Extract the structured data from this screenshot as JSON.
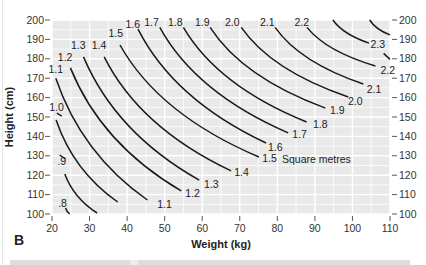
{
  "panel_label": "B",
  "chart_data": {
    "type": "line",
    "title": "",
    "xlabel": "Weight (kg)",
    "ylabel": "Height (cm)",
    "xlim": [
      20,
      110
    ],
    "ylim": [
      100,
      200
    ],
    "x_ticks": [
      20,
      30,
      40,
      50,
      60,
      70,
      80,
      90,
      100,
      110
    ],
    "y_ticks": [
      100,
      110,
      120,
      130,
      140,
      150,
      160,
      170,
      180,
      190,
      200
    ],
    "y_ticks_right": true,
    "grid": true,
    "background": "#e9e9e9",
    "grid_color": "#ffffff",
    "line_color": "#1a1a1a",
    "units_annotation": "Square metres",
    "series": [
      {
        "name": ".8",
        "label": ".8",
        "start": [
          23.6,
          103.1
        ],
        "end": [
          24.7,
          100.0
        ],
        "label_pos": [
          22.8,
          103.6
        ],
        "label_at": "start"
      },
      {
        "name": ".9",
        "label": ".9",
        "start": [
          23.4,
          120.6
        ],
        "end": [
          32.0,
          100.5
        ],
        "label_pos": [
          22.6,
          125.3
        ],
        "label_at": "start",
        "tail": [
          [
            22.0,
            130.4
          ],
          [
            23.6,
            128.4
          ]
        ]
      },
      {
        "name": "1.0",
        "label": "1.0",
        "start": [
          21.1,
          148.5
        ],
        "end": [
          37.5,
          106.2
        ],
        "label_pos": [
          21.2,
          153.0
        ],
        "label_at": "start",
        "tail": [
          [
            21.3,
            152.0
          ],
          [
            22.6,
            150.5
          ]
        ]
      },
      {
        "name": "1.1",
        "label": "1.1",
        "start": [
          21.0,
          170.0
        ],
        "end": [
          45.4,
          107.2
        ],
        "label_pos": [
          21.0,
          172.7
        ],
        "label_at": "start",
        "end_label": "1.1",
        "end_label_pos": [
          48.0,
          103.0
        ]
      },
      {
        "name": "1.2",
        "label": "1.2",
        "start": [
          24.9,
          175.3
        ],
        "end": [
          54.4,
          111.9
        ],
        "label_pos": [
          23.5,
          179.0
        ],
        "label_at": "start",
        "end_label": "1.2",
        "end_label_pos": [
          55.5,
          109.0
        ]
      },
      {
        "name": "1.3",
        "label": "1.3",
        "start": [
          28.4,
          181.0
        ],
        "end": [
          59.2,
          117.5
        ],
        "label_pos": [
          27.0,
          185.0
        ],
        "label_at": "start",
        "end_label": "1.3",
        "end_label_pos": [
          60.5,
          113.5
        ]
      },
      {
        "name": "1.4",
        "label": "1.4",
        "start": [
          33.9,
          181.0
        ],
        "end": [
          67.7,
          122.2
        ],
        "label_pos": [
          32.5,
          185.0
        ],
        "label_at": "start",
        "end_label": "1.4",
        "end_label_pos": [
          68.5,
          119.5
        ]
      },
      {
        "name": "1.5",
        "label": "1.5",
        "start": [
          38.1,
          187.1
        ],
        "end": [
          75.1,
          129.4
        ],
        "label_pos": [
          37.0,
          191.0
        ],
        "label_at": "start",
        "end_label": "1.5",
        "end_label_pos": [
          76.0,
          127.0
        ]
      },
      {
        "name": "1.6",
        "label": "1.6",
        "start": [
          42.9,
          195.3
        ],
        "end": [
          77.0,
          136.6
        ],
        "label_pos": [
          41.5,
          196.0
        ],
        "label_at": "start",
        "end_label": "1.6",
        "end_label_pos": [
          77.5,
          132.5
        ]
      },
      {
        "name": "1.7",
        "label": "1.7",
        "start": [
          48.7,
          196.2
        ],
        "end": [
          82.9,
          141.8
        ],
        "label_pos": [
          46.5,
          197.0
        ],
        "label_at": "start",
        "end_label": "1.7",
        "end_label_pos": [
          84.0,
          139.0
        ]
      },
      {
        "name": "1.8",
        "label": "1.8",
        "start": [
          55.0,
          196.2
        ],
        "end": [
          87.8,
          147.4
        ],
        "label_pos": [
          52.8,
          197.0
        ],
        "label_at": "start",
        "end_label": "1.8",
        "end_label_pos": [
          89.5,
          144.5
        ]
      },
      {
        "name": "1.9",
        "label": "1.9",
        "start": [
          62.1,
          196.2
        ],
        "end": [
          92.8,
          154.6
        ],
        "label_pos": [
          60.0,
          197.0
        ],
        "label_at": "start",
        "end_label": "1.9",
        "end_label_pos": [
          94.0,
          151.5
        ]
      },
      {
        "name": "2.0",
        "label": "2.0",
        "start": [
          70.4,
          196.2
        ],
        "end": [
          98.9,
          160.3
        ],
        "label_pos": [
          68.0,
          197.0
        ],
        "label_at": "start",
        "end_label": "2.0",
        "end_label_pos": [
          98.8,
          156.0
        ]
      },
      {
        "name": "2.1",
        "label": "2.1",
        "start": [
          79.4,
          196.2
        ],
        "end": [
          102.9,
          167.0
        ],
        "label_pos": [
          77.3,
          197.0
        ],
        "label_at": "start",
        "end_label": "2.1",
        "end_label_pos": [
          103.8,
          162.5
        ]
      },
      {
        "name": "2.2",
        "label": "2.2",
        "start": [
          87.9,
          196.2
        ],
        "end": [
          106.1,
          176.3
        ],
        "label_pos": [
          86.5,
          197.0
        ],
        "label_at": "start",
        "end_label": "2.2",
        "end_label_pos": [
          107.5,
          172.0
        ]
      },
      {
        "name": "2.3",
        "label": "2.3",
        "start": [
          94.8,
          200.0
        ],
        "end": [
          104.4,
          188.1
        ],
        "label_pos": [
          ", "
        ],
        "label_at": "end",
        "end_label": "2.3",
        "end_label_pos": [
          104.8,
          185.5
        ],
        "tail": [
          [
            108.3,
            182.8
          ],
          [
            110.0,
            179.7
          ]
        ]
      },
      {
        "name": "2.4",
        "label": "",
        "start": [
          104.6,
          200.0
        ],
        "end": [
          110.0,
          192.3
        ]
      }
    ]
  }
}
